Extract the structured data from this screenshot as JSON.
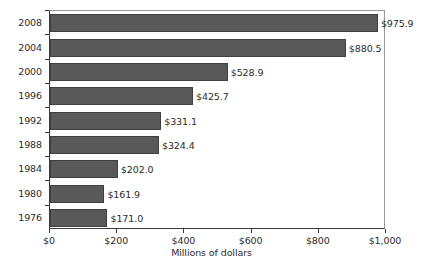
{
  "chart_data": {
    "type": "bar",
    "orientation": "horizontal",
    "title": "",
    "subtitle": "",
    "xlabel": "Millions of dollars",
    "ylabel": "",
    "xlim": [
      0,
      1000
    ],
    "x_ticks": [
      0,
      200,
      400,
      600,
      800,
      1000
    ],
    "x_tick_labels": [
      "$0",
      "$200",
      "$400",
      "$600",
      "$800",
      "$1,000"
    ],
    "grid": false,
    "legend": false,
    "legend_position": "none",
    "bar_color": "#595959",
    "bar_edge_color": "#3f3f3f",
    "axis_color": "#3a3a3a",
    "text_color": "#2b2b2b",
    "background_color": "#ffffff",
    "categories": [
      "2008",
      "2004",
      "2000",
      "1996",
      "1992",
      "1988",
      "1984",
      "1980",
      "1976"
    ],
    "values": [
      975.9,
      880.5,
      528.9,
      425.7,
      331.1,
      324.4,
      202.0,
      161.9,
      171.0
    ],
    "value_labels": [
      "$975.9",
      "$880.5",
      "$528.9",
      "$425.7",
      "$331.1",
      "$324.4",
      "$202.0",
      "$161.9",
      "$171.0"
    ],
    "bars": [
      {
        "category": "2008",
        "value": 975.9,
        "label": "$975.9"
      },
      {
        "category": "2004",
        "value": 880.5,
        "label": "$880.5"
      },
      {
        "category": "2000",
        "value": 528.9,
        "label": "$528.9"
      },
      {
        "category": "1996",
        "value": 425.7,
        "label": "$425.7"
      },
      {
        "category": "1992",
        "value": 331.1,
        "label": "$331.1"
      },
      {
        "category": "1988",
        "value": 324.4,
        "label": "$324.4"
      },
      {
        "category": "1984",
        "value": 202.0,
        "label": "$202.0"
      },
      {
        "category": "1980",
        "value": 161.9,
        "label": "$161.9"
      },
      {
        "category": "1976",
        "value": 171.0,
        "label": "$171.0"
      }
    ]
  }
}
